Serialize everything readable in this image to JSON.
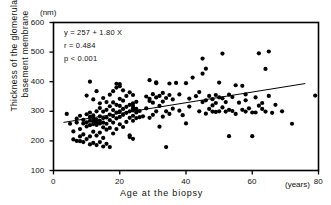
{
  "chart_data": {
    "type": "scatter",
    "title": "",
    "xlabel": "Age at the biopsy",
    "ylabel": "Thickness of the glomerular basement membrane",
    "ylabel_line1": "Thickness of the glomerular",
    "ylabel_line2": "basement membrane",
    "x_unit": "(years)",
    "y_unit": "(nm)",
    "xlim": [
      0,
      80
    ],
    "ylim": [
      100,
      600
    ],
    "xticks": [
      0,
      20,
      40,
      60,
      80
    ],
    "yticks": [
      100,
      200,
      300,
      400,
      500,
      600
    ],
    "xtick_labels": [
      "0",
      "20",
      "40",
      "60",
      "80"
    ],
    "ytick_labels": [
      "100",
      "200",
      "300",
      "400",
      "500",
      "600"
    ],
    "grid": false,
    "legend": "none",
    "marker": "filled-circle",
    "marker_color": "#000000",
    "annotations": {
      "equation": "y = 257 + 1.80 X",
      "correlation": "r = 0.484",
      "pvalue": "p < 0.001"
    },
    "regression": {
      "intercept": 257,
      "slope": 1.8,
      "x_start": 3,
      "x_end": 76,
      "color": "#000000"
    },
    "points": [
      [
        4,
        291
      ],
      [
        5,
        258
      ],
      [
        6,
        205
      ],
      [
        6,
        232
      ],
      [
        7,
        200
      ],
      [
        7,
        262
      ],
      [
        7,
        275
      ],
      [
        8,
        199
      ],
      [
        8,
        215
      ],
      [
        8,
        240
      ],
      [
        8,
        285
      ],
      [
        9,
        196
      ],
      [
        9,
        222
      ],
      [
        9,
        259
      ],
      [
        9,
        271
      ],
      [
        10,
        206
      ],
      [
        10,
        249
      ],
      [
        10,
        263
      ],
      [
        10,
        290
      ],
      [
        10,
        353
      ],
      [
        11,
        188
      ],
      [
        11,
        215
      ],
      [
        11,
        253
      ],
      [
        11,
        268
      ],
      [
        11,
        281
      ],
      [
        11,
        296
      ],
      [
        11,
        400
      ],
      [
        12,
        193
      ],
      [
        12,
        231
      ],
      [
        12,
        257
      ],
      [
        12,
        266
      ],
      [
        12,
        274
      ],
      [
        12,
        286
      ],
      [
        12,
        340
      ],
      [
        13,
        186
      ],
      [
        13,
        218
      ],
      [
        13,
        254
      ],
      [
        13,
        264
      ],
      [
        13,
        272
      ],
      [
        13,
        300
      ],
      [
        13,
        368
      ],
      [
        14,
        196
      ],
      [
        14,
        228
      ],
      [
        14,
        259
      ],
      [
        14,
        268
      ],
      [
        14,
        283
      ],
      [
        14,
        311
      ],
      [
        14,
        327
      ],
      [
        15,
        181
      ],
      [
        15,
        210
      ],
      [
        15,
        246
      ],
      [
        15,
        262
      ],
      [
        15,
        277
      ],
      [
        15,
        299
      ],
      [
        15,
        345
      ],
      [
        16,
        190
      ],
      [
        16,
        238
      ],
      [
        16,
        258
      ],
      [
        16,
        279
      ],
      [
        16,
        305
      ],
      [
        16,
        331
      ],
      [
        17,
        179
      ],
      [
        17,
        244
      ],
      [
        17,
        270
      ],
      [
        17,
        289
      ],
      [
        17,
        317
      ],
      [
        17,
        356
      ],
      [
        18,
        225
      ],
      [
        18,
        262
      ],
      [
        18,
        284
      ],
      [
        18,
        304
      ],
      [
        18,
        330
      ],
      [
        18,
        368
      ],
      [
        19,
        240
      ],
      [
        19,
        276
      ],
      [
        19,
        296
      ],
      [
        19,
        322
      ],
      [
        19,
        380
      ],
      [
        19,
        393
      ],
      [
        20,
        256
      ],
      [
        20,
        281
      ],
      [
        20,
        300
      ],
      [
        20,
        318
      ],
      [
        20,
        342
      ],
      [
        20,
        385
      ],
      [
        20,
        392
      ],
      [
        21,
        247
      ],
      [
        21,
        288
      ],
      [
        21,
        308
      ],
      [
        21,
        336
      ],
      [
        21,
        371
      ],
      [
        22,
        264
      ],
      [
        22,
        295
      ],
      [
        22,
        315
      ],
      [
        22,
        352
      ],
      [
        23,
        213
      ],
      [
        23,
        219
      ],
      [
        23,
        278
      ],
      [
        23,
        300
      ],
      [
        23,
        322
      ],
      [
        23,
        364
      ],
      [
        24,
        207
      ],
      [
        24,
        268
      ],
      [
        24,
        285
      ],
      [
        24,
        303
      ],
      [
        24,
        310
      ],
      [
        24,
        318
      ],
      [
        24,
        327
      ],
      [
        24,
        355
      ],
      [
        25,
        277
      ],
      [
        25,
        296
      ],
      [
        25,
        308
      ],
      [
        25,
        332
      ],
      [
        26,
        280
      ],
      [
        26,
        301
      ],
      [
        27,
        283
      ],
      [
        28,
        310
      ],
      [
        28,
        350
      ],
      [
        29,
        278
      ],
      [
        29,
        335
      ],
      [
        29,
        342
      ],
      [
        29,
        405
      ],
      [
        30,
        288
      ],
      [
        30,
        329
      ],
      [
        30,
        358
      ],
      [
        31,
        300
      ],
      [
        31,
        347
      ],
      [
        31,
        395
      ],
      [
        31,
        398
      ],
      [
        32,
        248
      ],
      [
        32,
        318
      ],
      [
        32,
        352
      ],
      [
        33,
        282
      ],
      [
        33,
        333
      ],
      [
        33,
        362
      ],
      [
        34,
        179
      ],
      [
        34,
        300
      ],
      [
        34,
        345
      ],
      [
        35,
        291
      ],
      [
        35,
        355
      ],
      [
        35,
        394
      ],
      [
        36,
        309
      ],
      [
        36,
        340
      ],
      [
        37,
        396
      ],
      [
        38,
        302
      ],
      [
        38,
        357
      ],
      [
        39,
        287
      ],
      [
        40,
        259
      ],
      [
        40,
        395
      ],
      [
        41,
        316
      ],
      [
        41,
        343
      ],
      [
        42,
        414
      ],
      [
        43,
        351
      ],
      [
        44,
        300
      ],
      [
        44,
        365
      ],
      [
        45,
        331
      ],
      [
        45,
        427
      ],
      [
        45,
        478
      ],
      [
        46,
        292
      ],
      [
        46,
        337
      ],
      [
        46,
        444
      ],
      [
        47,
        308
      ],
      [
        47,
        352
      ],
      [
        48,
        299
      ],
      [
        48,
        320
      ],
      [
        48,
        341
      ],
      [
        49,
        298
      ],
      [
        49,
        328
      ],
      [
        49,
        355
      ],
      [
        50,
        300
      ],
      [
        50,
        347
      ],
      [
        50,
        397
      ],
      [
        51,
        313
      ],
      [
        51,
        344
      ],
      [
        51,
        495
      ],
      [
        52,
        299
      ],
      [
        52,
        331
      ],
      [
        53,
        216
      ],
      [
        53,
        305
      ],
      [
        53,
        356
      ],
      [
        54,
        301
      ],
      [
        54,
        348
      ],
      [
        55,
        291
      ],
      [
        55,
        388
      ],
      [
        56,
        329
      ],
      [
        57,
        305
      ],
      [
        57,
        386
      ],
      [
        58,
        299
      ],
      [
        58,
        337
      ],
      [
        58,
        357
      ],
      [
        59,
        310
      ],
      [
        60,
        216
      ],
      [
        60,
        296
      ],
      [
        61,
        296
      ],
      [
        61,
        347
      ],
      [
        62,
        319
      ],
      [
        62,
        496
      ],
      [
        63,
        308
      ],
      [
        63,
        328
      ],
      [
        64,
        299
      ],
      [
        64,
        443
      ],
      [
        65,
        352
      ],
      [
        65,
        502
      ],
      [
        66,
        295
      ],
      [
        67,
        322
      ],
      [
        69,
        300
      ],
      [
        72,
        258
      ],
      [
        79,
        353
      ]
    ]
  }
}
